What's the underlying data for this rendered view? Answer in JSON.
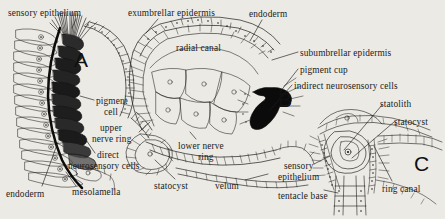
{
  "figure": {
    "background_color": "#eceae4",
    "ink_color": "#1b1b1b"
  },
  "panels": [
    {
      "id": "panel-a",
      "letter": "A",
      "x": 74,
      "y": 48,
      "subject": "ocellus pigment cup with direct neurosensory cells"
    },
    {
      "id": "panel-b",
      "letter": "B",
      "x": 278,
      "y": 88,
      "subject": "bell margin section with radial canal, nerve rings and velum"
    },
    {
      "id": "panel-c",
      "letter": "C",
      "x": 414,
      "y": 152,
      "subject": "statocyst and tentacle base"
    }
  ],
  "labels": [
    {
      "id": "sensory-epithelium-top",
      "text": "sensory epithelium",
      "x": 8,
      "y": 8,
      "align": "left"
    },
    {
      "id": "exumbrellar-epidermis",
      "text": "exumbrellar epidermis",
      "x": 128,
      "y": 8,
      "align": "left"
    },
    {
      "id": "endoderm-top",
      "text": "endoderm",
      "x": 249,
      "y": 9,
      "align": "left"
    },
    {
      "id": "radial-canal",
      "text": "radial canal",
      "x": 176,
      "y": 43,
      "align": "left"
    },
    {
      "id": "subumbrellar-epidermis",
      "text": "subumbrellar epidermis",
      "x": 300,
      "y": 48,
      "align": "left"
    },
    {
      "id": "pigment-cup",
      "text": "pigment cup",
      "x": 300,
      "y": 65,
      "align": "left"
    },
    {
      "id": "indirect-neurosensory-cells",
      "text": "indirect neurosensory cells",
      "x": 294,
      "y": 81,
      "align": "left"
    },
    {
      "id": "pigment-cell",
      "text": "pigment",
      "x": 96,
      "y": 96,
      "align": "left"
    },
    {
      "id": "pigment-cell-2",
      "text": "cell",
      "x": 104,
      "y": 107,
      "align": "left"
    },
    {
      "id": "upper-nerve-ring",
      "text": "upper",
      "x": 100,
      "y": 123,
      "align": "left"
    },
    {
      "id": "upper-nerve-ring-2",
      "text": "nerve ring",
      "x": 92,
      "y": 134,
      "align": "left"
    },
    {
      "id": "direct-neurosensory",
      "text": "direct",
      "x": 97,
      "y": 150,
      "align": "left"
    },
    {
      "id": "direct-neurosensory-2",
      "text": "neurosensory cells",
      "x": 68,
      "y": 161,
      "align": "left"
    },
    {
      "id": "endoderm-bottom",
      "text": "endoderm",
      "x": 6,
      "y": 189,
      "align": "left"
    },
    {
      "id": "mesolamella",
      "text": "mesolamella",
      "x": 72,
      "y": 187,
      "align": "left"
    },
    {
      "id": "lower-nerve-ring",
      "text": "lower nerve",
      "x": 178,
      "y": 141,
      "align": "left"
    },
    {
      "id": "lower-nerve-ring-2",
      "text": "ring",
      "x": 198,
      "y": 152,
      "align": "left"
    },
    {
      "id": "statocyst-b",
      "text": "statocyst",
      "x": 154,
      "y": 181,
      "align": "left"
    },
    {
      "id": "velum",
      "text": "velum",
      "x": 215,
      "y": 181,
      "align": "left"
    },
    {
      "id": "statolith",
      "text": "statolith",
      "x": 380,
      "y": 99,
      "align": "left"
    },
    {
      "id": "statocyst-c",
      "text": "statocyst",
      "x": 394,
      "y": 117,
      "align": "left"
    },
    {
      "id": "sensory-epithelium-c",
      "text": "sensory",
      "x": 284,
      "y": 161,
      "align": "left"
    },
    {
      "id": "sensory-epithelium-c-2",
      "text": "epithelium",
      "x": 278,
      "y": 172,
      "align": "left"
    },
    {
      "id": "tentacle-base",
      "text": "tentacle base",
      "x": 278,
      "y": 191,
      "align": "left"
    },
    {
      "id": "ring-canal",
      "text": "ring canal",
      "x": 382,
      "y": 184,
      "align": "left"
    }
  ]
}
